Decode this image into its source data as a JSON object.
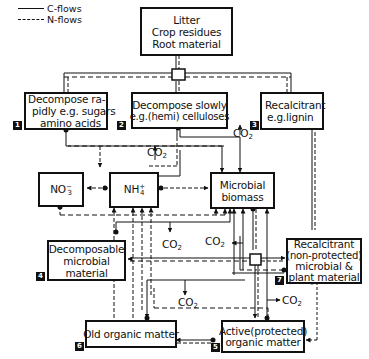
{
  "legend": {
    "c_flows": "C-flows",
    "n_flows": "N-flows"
  },
  "nodes": {
    "litter": {
      "lines": [
        "Litter",
        "Crop residues",
        "Root material"
      ]
    },
    "rapid": {
      "number": "1",
      "lines": [
        "Decompose ra-",
        "pidly e.g. sugars",
        "amino acids"
      ]
    },
    "slow": {
      "number": "2",
      "lines": [
        "Decompose slowly",
        "e.g.(hemi) celluloses"
      ]
    },
    "recalcitrant": {
      "number": "3",
      "lines": [
        "Recalcitrant",
        "e.g.lignin"
      ]
    },
    "nitrate": {
      "label": "NO",
      "sub": "3",
      "sup": "−"
    },
    "ammonium": {
      "label": "NH",
      "sub": "4",
      "sup": "+"
    },
    "microbial_biomass": {
      "lines": [
        "Microbial",
        "biomass"
      ]
    },
    "decomposable_microbial": {
      "number": "4",
      "lines": [
        "Decomposable",
        "microbial",
        "material"
      ]
    },
    "recalcitrant_nonprotected": {
      "number": "7",
      "lines": [
        "Recalcitrant",
        "(non-protected)",
        "microbial &",
        "plant material"
      ]
    },
    "old_organic": {
      "number": "6",
      "lines": [
        "Old organic matter"
      ]
    },
    "active_protected": {
      "number": "5",
      "lines": [
        "Active(protected)",
        "organic matter"
      ]
    }
  },
  "co2_labels": [
    {
      "id": "co2-slow-left",
      "text": "CO",
      "sub": "2"
    },
    {
      "id": "co2-slow-right",
      "text": "CO",
      "sub": "2"
    },
    {
      "id": "co2-mid-left",
      "text": "CO",
      "sub": "2"
    },
    {
      "id": "co2-mid-right",
      "text": "CO",
      "sub": "2"
    },
    {
      "id": "co2-lower-left",
      "text": "CO",
      "sub": "2"
    },
    {
      "id": "co2-lower-right",
      "text": "CO",
      "sub": "2"
    }
  ],
  "colors": {
    "line": "#111111",
    "background": "#ffffff"
  }
}
